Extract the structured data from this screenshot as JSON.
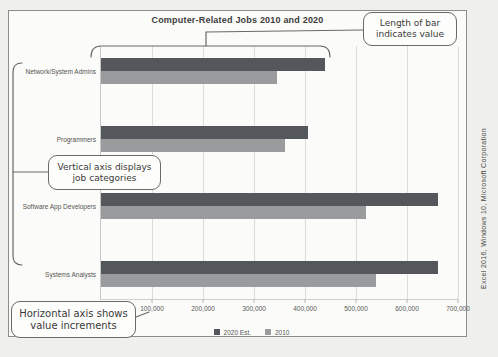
{
  "page": {
    "side_caption": "Excel 2016, Windows 10, Microsoft Corporation"
  },
  "chart_data": {
    "type": "bar",
    "orientation": "horizontal",
    "title": "Computer-Related Jobs 2010 and 2020",
    "categories": [
      "Network/System Admins",
      "Programmers",
      "Software App Developers",
      "Systems Analysts"
    ],
    "series": [
      {
        "name": "2020 Est.",
        "color": "#54585c",
        "values": [
          440000,
          405000,
          660000,
          660000
        ]
      },
      {
        "name": "2010",
        "color": "#9a9b9d",
        "values": [
          345000,
          360000,
          520000,
          540000
        ]
      }
    ],
    "xlim": [
      0,
      700000
    ],
    "x_tick_values": [
      100000,
      200000,
      300000,
      400000,
      500000,
      600000,
      700000
    ],
    "x_ticks": [
      "100,000",
      "200,000",
      "300,000",
      "400,000",
      "500,000",
      "600,000",
      "700,000"
    ],
    "grid": "vertical",
    "legend_position": "bottom"
  },
  "annotations": {
    "bar_length": {
      "line1": "Length of bar",
      "line2": "indicates value"
    },
    "vertical_axis": {
      "line1": "Vertical axis displays",
      "line2": "job categories"
    },
    "horizontal_axis": {
      "line1": "Horizontal axis shows",
      "line2": "value increments"
    }
  },
  "colors": {
    "grid": "#dcdcda",
    "callout_border": "#6a6a68",
    "chart_border": "#8d8d8b"
  }
}
